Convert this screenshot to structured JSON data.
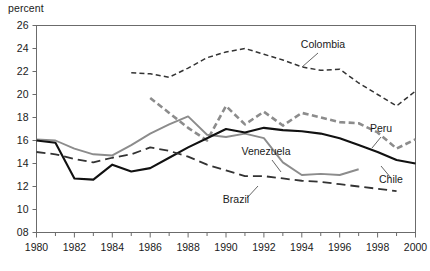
{
  "axis_unit_label": "percent",
  "colors": {
    "chile": "#111111",
    "venezuela": "#8c8c8c",
    "peru": "#8c8c8c",
    "colombia": "#333333",
    "brazil": "#333333",
    "frame": "#6b6b6b",
    "text": "#1a1a1a"
  },
  "chart_data": {
    "type": "line",
    "title": "",
    "subtitle": "",
    "xlabel": "",
    "ylabel": "percent",
    "xlim": [
      1980,
      2000
    ],
    "ylim": [
      8,
      26
    ],
    "ytick_labels": [
      "08",
      "10",
      "12",
      "14",
      "16",
      "18",
      "20",
      "22",
      "24",
      "26"
    ],
    "yticks": [
      8,
      10,
      12,
      14,
      16,
      18,
      20,
      22,
      24,
      26
    ],
    "xtick_labels": [
      "1980",
      "1982",
      "1984",
      "1986",
      "1988",
      "1990",
      "1992",
      "1994",
      "1996",
      "1998",
      "2000"
    ],
    "xticks": [
      1980,
      1982,
      1984,
      1986,
      1988,
      1990,
      1992,
      1994,
      1996,
      1998,
      2000
    ],
    "xticks_minor": [
      1981,
      1983,
      1985,
      1987,
      1989,
      1991,
      1993,
      1995,
      1997,
      1999
    ],
    "grid": false,
    "legend": "inline-annotations",
    "series": [
      {
        "name": "Colombia",
        "style": "dashed-thin",
        "color": "#333333",
        "x": [
          1985,
          1986,
          1987,
          1988,
          1989,
          1990,
          1991,
          1992,
          1993,
          1994,
          1995,
          1996,
          1997,
          1998,
          1999,
          2000
        ],
        "values": [
          21.9,
          21.8,
          21.5,
          22.3,
          23.2,
          23.7,
          24.0,
          23.5,
          23.0,
          22.4,
          22.1,
          22.2,
          21.0,
          20.0,
          19.0,
          20.3
        ]
      },
      {
        "name": "Peru",
        "style": "dashed-thick",
        "color": "#8c8c8c",
        "x": [
          1986,
          1987,
          1988,
          1989,
          1990,
          1991,
          1992,
          1993,
          1994,
          1995,
          1996,
          1997,
          1998,
          1999,
          2000
        ],
        "values": [
          19.7,
          18.4,
          17.1,
          16.0,
          19.0,
          17.4,
          18.5,
          17.3,
          18.4,
          18.0,
          17.6,
          17.5,
          16.7,
          15.3,
          16.1
        ]
      },
      {
        "name": "Venezuela",
        "style": "solid-gray",
        "color": "#8c8c8c",
        "x": [
          1980,
          1981,
          1982,
          1983,
          1984,
          1985,
          1986,
          1987,
          1988,
          1989,
          1990,
          1991,
          1992,
          1993,
          1994,
          1995,
          1996,
          1997
        ],
        "values": [
          16.1,
          16.0,
          15.3,
          14.8,
          14.7,
          15.6,
          16.6,
          17.4,
          18.1,
          16.5,
          16.3,
          16.6,
          16.2,
          14.1,
          13.0,
          13.1,
          13.0,
          13.5
        ]
      },
      {
        "name": "Chile",
        "style": "solid-black",
        "color": "#111111",
        "x": [
          1980,
          1981,
          1982,
          1983,
          1984,
          1985,
          1986,
          1987,
          1988,
          1989,
          1990,
          1991,
          1992,
          1993,
          1994,
          1995,
          1996,
          1997,
          1998,
          1999,
          2000
        ],
        "values": [
          16.0,
          15.8,
          12.7,
          12.6,
          13.9,
          13.3,
          13.6,
          14.5,
          15.4,
          16.2,
          17.0,
          16.7,
          17.1,
          16.9,
          16.8,
          16.6,
          16.2,
          15.6,
          15.0,
          14.3,
          14.0
        ]
      },
      {
        "name": "Brazil",
        "style": "dashed-long",
        "color": "#333333",
        "x": [
          1980,
          1981,
          1982,
          1983,
          1984,
          1985,
          1986,
          1987,
          1988,
          1989,
          1990,
          1991,
          1992,
          1993,
          1994,
          1995,
          1996,
          1997,
          1998,
          1999
        ],
        "values": [
          15.0,
          14.8,
          14.4,
          14.1,
          14.5,
          14.8,
          15.4,
          15.1,
          14.6,
          13.9,
          13.4,
          12.9,
          12.9,
          12.7,
          12.5,
          12.4,
          12.2,
          12.0,
          11.8,
          11.6
        ]
      }
    ],
    "annotations": [
      {
        "label": "Colombia",
        "x": 323,
        "y": 48,
        "leader": [
          [
            318,
            53
          ],
          [
            302,
            67
          ]
        ]
      },
      {
        "label": "Peru",
        "x": 381,
        "y": 132,
        "leader": [
          [
            381,
            137
          ],
          [
            372,
            148
          ]
        ]
      },
      {
        "label": "Venezuela",
        "x": 266,
        "y": 155,
        "leader": [
          [
            272,
            160
          ],
          [
            281,
            172
          ]
        ]
      },
      {
        "label": "Chile",
        "x": 391,
        "y": 183,
        "leader": [
          [
            391,
            178
          ],
          [
            381,
            166
          ]
        ]
      },
      {
        "label": "Brazil",
        "x": 236,
        "y": 203,
        "leader": [
          [
            247,
            198
          ],
          [
            258,
            186
          ]
        ]
      }
    ]
  }
}
